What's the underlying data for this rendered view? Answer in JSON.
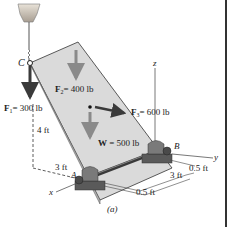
{
  "figure": {
    "caption": "(a)",
    "points": {
      "A": "A",
      "B": "B",
      "C": "C"
    },
    "axes": {
      "x": "x",
      "y": "y",
      "z": "z"
    },
    "forces": {
      "F1": {
        "symbol": "F",
        "sub": "1",
        "value": "= 300 lb"
      },
      "F2": {
        "symbol": "F",
        "sub": "2",
        "value": "= 400 lb"
      },
      "F3": {
        "symbol": "F",
        "sub": "3",
        "value": "= 600 lb"
      },
      "W": {
        "symbol": "W",
        "value": " = 500 lb"
      }
    },
    "dimensions": {
      "d_4ft": "4 ft",
      "d_3ft_left": "3 ft",
      "d_3ft_right": "3 ft",
      "d_05ft_bottom": "0.5 ft",
      "d_05ft_right": "0.5 ft"
    },
    "colors": {
      "plate": "#d9d9d9",
      "plate_edge": "#333333",
      "force_dark": "#3a3a3a",
      "force_gray": "#8a8a8a",
      "bearing": "#6f6f6f"
    }
  }
}
